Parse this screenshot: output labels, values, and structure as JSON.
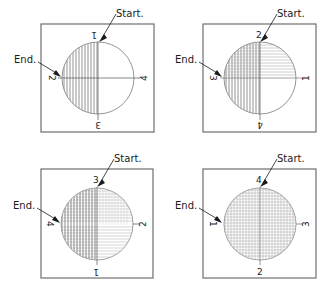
{
  "diagram": {
    "title": "",
    "colors": {
      "frame": "#6e6e6e",
      "circle": "#8a8a8a",
      "hatch": "#4a4a4a",
      "hatch_light": "#b0b0b0",
      "text": "#1a1a1a"
    },
    "panels": [
      {
        "id": "panel-1",
        "start_label": "Start.",
        "end_label": "End.",
        "numbers": {
          "top": "1",
          "left": "2",
          "bottom": "3",
          "right": "4"
        },
        "fill": "left-half-vertical"
      },
      {
        "id": "panel-2",
        "start_label": "Start.",
        "end_label": "End.",
        "numbers": {
          "top": "2",
          "left": "3",
          "bottom": "4",
          "right": "1"
        },
        "fill": "left-vertical-plus-right-horizontal"
      },
      {
        "id": "panel-3",
        "start_label": "Start.",
        "end_label": "End.",
        "numbers": {
          "top": "3",
          "left": "4",
          "bottom": "1",
          "right": "2"
        },
        "fill": "left-crosshatch-plus-right-horizontal"
      },
      {
        "id": "panel-4",
        "start_label": "Start.",
        "end_label": "End.",
        "numbers": {
          "top": "4",
          "left": "1",
          "bottom": "2",
          "right": "3"
        },
        "fill": "full-crosshatch"
      }
    ]
  }
}
